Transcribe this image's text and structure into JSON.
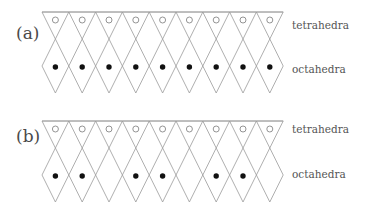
{
  "panels": [
    {
      "label": "(a)",
      "top_y": 12,
      "columns": 9,
      "tetrahedra_label": "tetrahedra",
      "octahedra_label": "octahedra",
      "tetrahedra_marker": "open-circle",
      "octahedra_filled": [
        true,
        true,
        true,
        true,
        true,
        true,
        true,
        true,
        true
      ]
    },
    {
      "label": "(b)",
      "top_y": 121,
      "columns": 9,
      "tetrahedra_label": "tetrahedra",
      "octahedra_label": "octahedra",
      "tetrahedra_marker": "open-circle",
      "octahedra_filled": [
        true,
        true,
        false,
        true,
        true,
        false,
        true,
        true,
        false
      ]
    }
  ],
  "style": {
    "line_color": "#9a9a9a",
    "dot_color": "#111111",
    "circle_color": "#888888"
  }
}
